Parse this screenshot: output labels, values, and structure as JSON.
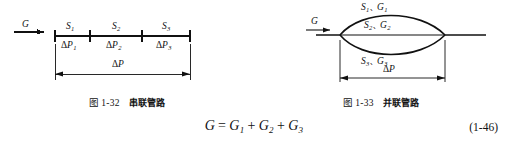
{
  "figures": [
    {
      "id": "series-pipe",
      "caption_number": "图 1-32",
      "caption_title": "串联管路",
      "inlet_label": "G",
      "total_label_delta": "Δ",
      "total_label_p": "P",
      "segments": [
        {
          "top_symbol": "S",
          "top_sub": "1",
          "bottom_delta": "Δ",
          "bottom_symbol": "P",
          "bottom_sub": "1"
        },
        {
          "top_symbol": "S",
          "top_sub": "2",
          "bottom_delta": "Δ",
          "bottom_symbol": "P",
          "bottom_sub": "2"
        },
        {
          "top_symbol": "S",
          "top_sub": "3",
          "bottom_delta": "Δ",
          "bottom_symbol": "P",
          "bottom_sub": "3"
        }
      ]
    },
    {
      "id": "parallel-pipe",
      "caption_number": "图 1-33",
      "caption_title": "并联管路",
      "inlet_label": "G",
      "total_label_delta": "Δ",
      "total_label_p": "P",
      "branches": [
        {
          "s_symbol": "S",
          "s_sub": "1",
          "sep": "、",
          "g_symbol": "G",
          "g_sub": "1"
        },
        {
          "s_symbol": "S",
          "s_sub": "2",
          "sep": "、",
          "g_symbol": "G",
          "g_sub": "2"
        },
        {
          "s_symbol": "S",
          "s_sub": "3",
          "sep": "、",
          "g_symbol": "G",
          "g_sub": "3"
        }
      ]
    }
  ],
  "equation": {
    "lhs": "G",
    "equals": "=",
    "term1_symbol": "G",
    "term1_sub": "1",
    "plus1": "+",
    "term2_symbol": "G",
    "term2_sub": "2",
    "plus2": "+",
    "term3_symbol": "G",
    "term3_sub": "3",
    "number": "(1-46)"
  },
  "colors": {
    "ink": "#111111",
    "background": "#ffffff"
  }
}
